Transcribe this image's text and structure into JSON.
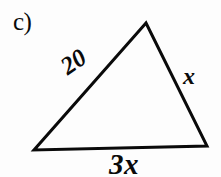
{
  "figure": {
    "part_label": "c)",
    "background_color": "#fdfdfd",
    "stroke_color": "#0a0a0a",
    "stroke_width": 3,
    "width": 221,
    "height": 177
  },
  "triangle": {
    "vertices": {
      "apex": {
        "x": 146,
        "y": 23
      },
      "bottom_left": {
        "x": 34,
        "y": 150
      },
      "bottom_right": {
        "x": 207,
        "y": 146
      }
    },
    "points_attr": "146,23 34,150 207,146"
  },
  "labels": {
    "left_side": "20",
    "right_side": "x",
    "base": "3x"
  },
  "chart_data": {
    "type": "diagram",
    "shape": "triangle",
    "title": "c)",
    "sides": [
      {
        "name": "left",
        "label": "20",
        "from": "bottom_left",
        "to": "apex"
      },
      {
        "name": "right",
        "label": "x",
        "from": "apex",
        "to": "bottom_right"
      },
      {
        "name": "base",
        "label": "3x",
        "from": "bottom_left",
        "to": "bottom_right"
      }
    ]
  }
}
